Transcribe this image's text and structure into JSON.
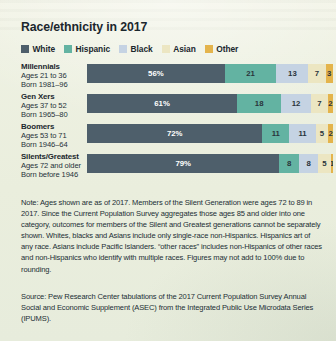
{
  "chart_title": "Race/ethnicity in 2017",
  "legend": {
    "items": [
      {
        "label": "White",
        "color": "#4e5f6b"
      },
      {
        "label": "Hispanic",
        "color": "#63b3a2"
      },
      {
        "label": "Black",
        "color": "#c5d3e3"
      },
      {
        "label": "Asian",
        "color": "#ece6c2"
      },
      {
        "label": "Other",
        "color": "#e4b44c"
      }
    ]
  },
  "chart_data": {
    "type": "bar",
    "title": "Race/ethnicity in 2017",
    "xlabel": "",
    "ylabel": "",
    "xlim": [
      0,
      100
    ],
    "grid": false,
    "legend_position": "top-left",
    "orientation": "horizontal",
    "stacked": true,
    "categories": [
      "Millennials",
      "Gen Xers",
      "Boomers",
      "Silents/Greatest"
    ],
    "category_sublabels": [
      [
        "Ages 21 to 36",
        "Born 1981–96"
      ],
      [
        "Ages 37 to 52",
        "Born 1965–80"
      ],
      [
        "Ages 53 to 71",
        "Born 1946–64"
      ],
      [
        "Ages 72 and older",
        "Born before 1946"
      ]
    ],
    "series": [
      {
        "name": "White",
        "color": "#4e5f6b",
        "values": [
          56,
          61,
          72,
          79
        ]
      },
      {
        "name": "Hispanic",
        "color": "#63b3a2",
        "values": [
          21,
          18,
          11,
          8
        ]
      },
      {
        "name": "Black",
        "color": "#c5d3e3",
        "values": [
          13,
          12,
          11,
          8
        ]
      },
      {
        "name": "Asian",
        "color": "#ece6c2",
        "values": [
          7,
          7,
          5,
          5
        ]
      },
      {
        "name": "Other",
        "color": "#e4b44c",
        "values": [
          3,
          2,
          2,
          1
        ]
      }
    ],
    "data_labels": [
      [
        "56%",
        "21",
        "13",
        "7",
        "3"
      ],
      [
        "61%",
        "18",
        "12",
        "7",
        "2"
      ],
      [
        "72%",
        "11",
        "11",
        "5",
        "2"
      ],
      [
        "79%",
        "8",
        "8",
        "5",
        "1"
      ]
    ]
  },
  "note": "Note: Ages shown are as of 2017. Members of the Silent Generation were ages 72 to 89 in 2017. Since the Current Population Survey aggregates those ages 85 and older into one category, outcomes for members of the Silent and Greatest generations cannot be separately shown. Whites, blacks and Asians include only single-race non-Hispanics. Hispanics art of any race. Asians include Pacific Islanders. “other races” includes non-Hispanics of other races and non-Hispanics who identify with multiple races. Figures may not add to 100% due to rounding.",
  "source": "Source: Pew Research Center tabulations of the 2017 Current Population Survey Annual Social and Economic Supplement (ASEC) from the Integrated Public Use Microdata Series (IPUMS)."
}
